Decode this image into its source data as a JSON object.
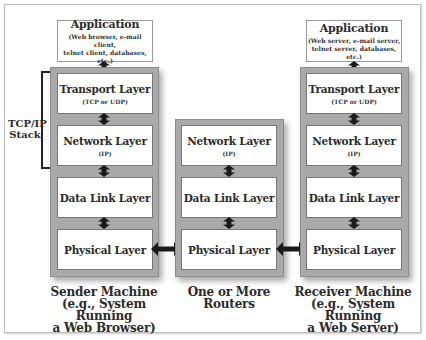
{
  "diagram": {
    "type": "TCP/IP layered network communication",
    "stack_label": "TCP/IP Stack",
    "colors": {
      "stack_frame": "#a9a9a9",
      "box_fill": "#ffffff",
      "arrow": "#1a1a1a",
      "text": "#2b2b2b"
    },
    "columns": [
      {
        "id": "sender",
        "application": {
          "title": "Application",
          "subtitle_line1": "(Web browser, e-mail client,",
          "subtitle_line2": "telnet client, databases, etc.)"
        },
        "layers": [
          {
            "title": "Transport Layer",
            "subtitle": "(TCP or UDP)"
          },
          {
            "title": "Network Layer",
            "subtitle": "(IP)"
          },
          {
            "title": "Data Link Layer",
            "subtitle": ""
          },
          {
            "title": "Physical Layer",
            "subtitle": ""
          }
        ],
        "caption_line1": "Sender Machine",
        "caption_line2": "(e.g., System Running",
        "caption_line3": "a Web Browser)"
      },
      {
        "id": "routers",
        "layers": [
          {
            "title": "Network Layer",
            "subtitle": "(IP)"
          },
          {
            "title": "Data Link Layer",
            "subtitle": ""
          },
          {
            "title": "Physical Layer",
            "subtitle": ""
          }
        ],
        "caption_line1": "One or More",
        "caption_line2": "Routers"
      },
      {
        "id": "receiver",
        "application": {
          "title": "Application",
          "subtitle_line1": "(Web server, e-mail server,",
          "subtitle_line2": "telnet server, databases, etc.)"
        },
        "layers": [
          {
            "title": "Transport Layer",
            "subtitle": "(TCP or UDP)"
          },
          {
            "title": "Network Layer",
            "subtitle": "(IP)"
          },
          {
            "title": "Data Link Layer",
            "subtitle": ""
          },
          {
            "title": "Physical Layer",
            "subtitle": ""
          }
        ],
        "caption_line1": "Receiver Machine",
        "caption_line2": "(e.g., System Running",
        "caption_line3": "a Web Server)"
      }
    ],
    "connections": [
      {
        "from": "sender.Physical Layer",
        "to": "routers.Physical Layer",
        "type": "bidirectional"
      },
      {
        "from": "routers.Physical Layer",
        "to": "receiver.Physical Layer",
        "type": "bidirectional"
      }
    ]
  }
}
